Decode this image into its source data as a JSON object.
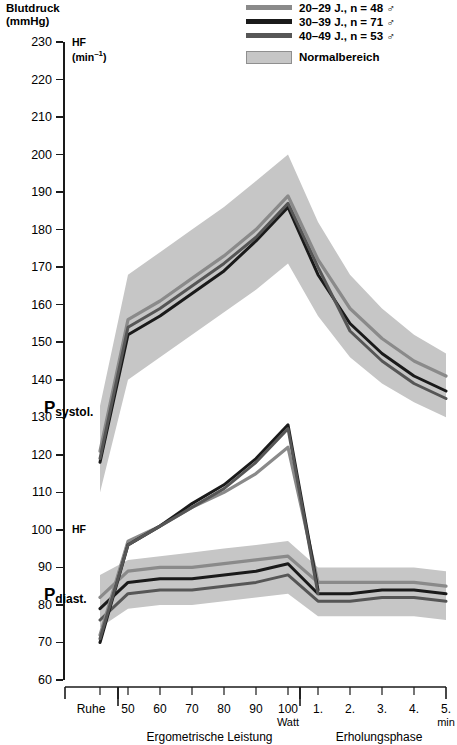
{
  "header": {
    "title_line1": "Blutdruck",
    "title_line2": "(mmHg)"
  },
  "legend": {
    "items": [
      {
        "label": "20–29 J., n = 48 ♂",
        "color": "#8a8a8a",
        "name": "legend-series-20-29"
      },
      {
        "label": "30–39 J., n = 71 ♂",
        "color": "#1a1a1a",
        "name": "legend-series-30-39"
      },
      {
        "label": "40–49 J., n = 53 ♂",
        "color": "#565656",
        "name": "legend-series-40-49"
      }
    ],
    "band_label": "Normalbereich",
    "band_color": "#c6c6c6"
  },
  "annotations": {
    "hf_top_line1": "HF",
    "hf_top_line2_pre": "(min",
    "hf_top_line2_sup": "–1",
    "hf_top_line2_post": ")",
    "hf_mid": "HF",
    "p_systol_main": "P",
    "p_systol_sub": "systol.",
    "p_diast_main": "P",
    "p_diast_sub": "diast."
  },
  "axes": {
    "y_ticks": [
      230,
      220,
      210,
      200,
      190,
      180,
      170,
      160,
      150,
      140,
      130,
      120,
      110,
      100,
      90,
      80,
      70,
      60
    ],
    "y_unit": "mmHg",
    "x_labels": [
      "Ruhe",
      "50",
      "60",
      "70",
      "80",
      "90",
      "100",
      "1.",
      "2.",
      "3.",
      "4.",
      "5."
    ],
    "x_sub_watt": "Watt",
    "x_sub_min": "min",
    "x_group_left": "Ergometrische Leistung",
    "x_group_right": "Erholungsphase"
  },
  "chart_data": {
    "type": "line",
    "title": "Blutdruck (mmHg)",
    "xlabel": "Ergometrische Leistung / Erholungsphase",
    "ylabel": "Blutdruck (mmHg)",
    "ylim": [
      60,
      230
    ],
    "grid": false,
    "legend_position": "top-right",
    "x": [
      "Ruhe",
      "50 Watt",
      "60 Watt",
      "70 Watt",
      "80 Watt",
      "90 Watt",
      "100 Watt",
      "1. min",
      "2. min",
      "3. min",
      "4. min",
      "5. min"
    ],
    "panels": [
      {
        "name": "P_systol",
        "band": {
          "label": "Normalbereich",
          "upper": [
            133,
            168,
            174,
            180,
            186,
            193,
            200,
            182,
            168,
            159,
            152,
            147
          ],
          "lower": [
            110,
            140,
            146,
            152,
            158,
            164,
            171,
            157,
            146,
            139,
            134,
            130
          ]
        },
        "series": [
          {
            "name": "20–29 J., n = 48",
            "color": "#8a8a8a",
            "values": [
              121,
              156,
              161,
              167,
              173,
              180,
              189,
              172,
              159,
              151,
              145,
              141
            ]
          },
          {
            "name": "30–39 J., n = 71",
            "color": "#1a1a1a",
            "values": [
              118,
              152,
              157,
              163,
              169,
              177,
              186,
              168,
              155,
              147,
              141,
              137
            ]
          },
          {
            "name": "40–49 J., n = 53",
            "color": "#565656",
            "values": [
              119,
              154,
              159,
              165,
              171,
              178,
              187,
              170,
              153,
              145,
              139,
              135
            ]
          }
        ]
      },
      {
        "name": "P_diast",
        "band": {
          "label": "Normalbereich",
          "upper": [
            88,
            92,
            93,
            94,
            95,
            96,
            97,
            90,
            90,
            90,
            90,
            89
          ],
          "lower": [
            74,
            79,
            80,
            80,
            81,
            82,
            83,
            77,
            77,
            77,
            77,
            76
          ]
        },
        "series": [
          {
            "name": "20–29 J., n = 48",
            "color": "#8a8a8a",
            "values": [
              82,
              89,
              90,
              90,
              91,
              92,
              93,
              86,
              86,
              86,
              86,
              85
            ]
          },
          {
            "name": "30–39 J., n = 71",
            "color": "#1a1a1a",
            "values": [
              79,
              86,
              87,
              87,
              88,
              89,
              91,
              83,
              83,
              84,
              84,
              83
            ]
          },
          {
            "name": "40–49 J., n = 53",
            "color": "#565656",
            "values": [
              76,
              83,
              84,
              84,
              85,
              86,
              88,
              81,
              81,
              82,
              82,
              81
            ]
          }
        ]
      },
      {
        "name": "HF",
        "unit": "min⁻¹",
        "series": [
          {
            "name": "20–29 J., n = 48",
            "color": "#8a8a8a",
            "values": [
              72,
              97,
              101,
              106,
              110,
              115,
              122,
              86,
              null,
              null,
              null,
              null
            ]
          },
          {
            "name": "30–39 J., n = 71",
            "color": "#1a1a1a",
            "values": [
              70,
              96,
              101,
              107,
              112,
              119,
              128,
              84,
              null,
              null,
              null,
              null
            ]
          },
          {
            "name": "40–49 J., n = 53",
            "color": "#565656",
            "values": [
              71,
              96,
              101,
              106,
              111,
              118,
              127,
              83,
              null,
              null,
              null,
              null
            ]
          }
        ]
      }
    ]
  }
}
